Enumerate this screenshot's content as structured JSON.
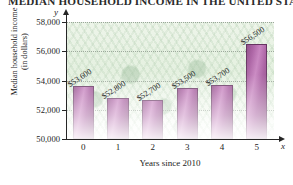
{
  "chart_data": {
    "type": "bar",
    "title": "MEDIAN HOUSEHOLD INCOME IN THE UNITED STATES",
    "xlabel": "Years since 2010",
    "ylabel_line1": "Median household income",
    "ylabel_line2": "(in dollars)",
    "x_axis_letter": "x",
    "y_axis_letter": "y",
    "categories": [
      "0",
      "1",
      "2",
      "3",
      "4",
      "5"
    ],
    "values": [
      53600,
      52800,
      52700,
      53500,
      53700,
      56500
    ],
    "value_labels": [
      "$53,600",
      "$52,800",
      "$52,700",
      "$53,500",
      "$53,700",
      "$56,500"
    ],
    "ylim": [
      50000,
      58000
    ],
    "ytick_labels": [
      "50,000",
      "52,000",
      "54,000",
      "56,000",
      "58,000"
    ],
    "ytick_values": [
      50000,
      52000,
      54000,
      56000,
      58000
    ],
    "grid": true,
    "legend": null,
    "bar_color": "#a85ca0",
    "bar_edge_color": "#5f2b5a",
    "plot_background_color": "#e2efdd",
    "axis_color": "#262626"
  }
}
